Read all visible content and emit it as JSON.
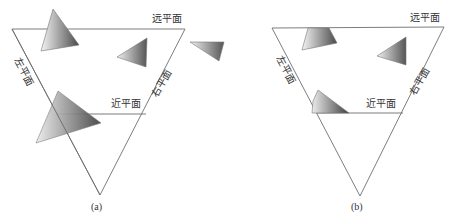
{
  "figure": {
    "panels": [
      {
        "id": "a",
        "caption": "(a)",
        "labels": {
          "far": "远平面",
          "near": "近平面",
          "left": "左平面",
          "right": "右平面"
        }
      },
      {
        "id": "b",
        "caption": "(b)",
        "labels": {
          "far": "远平面",
          "near": "近平面",
          "left": "左平面",
          "right": "右平面"
        }
      }
    ],
    "colors": {
      "edge": "#6e6e6e",
      "tri_dark": "#555555",
      "tri_light": "#f2f2f2"
    }
  }
}
